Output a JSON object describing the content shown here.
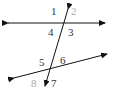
{
  "diagram": {
    "colors": {
      "line": "#111111",
      "label_dark": "#333333",
      "label_light": "#aaaaaa"
    },
    "labels": [
      {
        "text": "1",
        "x": 51,
        "y": 6,
        "color": "#333333"
      },
      {
        "text": "2",
        "x": 71,
        "y": 6,
        "color": "#aaaaaa"
      },
      {
        "text": "4",
        "x": 48,
        "y": 27,
        "color": "#333333"
      },
      {
        "text": "3",
        "x": 68,
        "y": 27,
        "color": "#333333"
      },
      {
        "text": "5",
        "x": 39,
        "y": 57,
        "color": "#333333"
      },
      {
        "text": "6",
        "x": 60,
        "y": 55,
        "color": "#333333"
      },
      {
        "text": "8",
        "x": 31,
        "y": 78,
        "color": "#aaaaaa"
      },
      {
        "text": "7",
        "x": 51,
        "y": 78,
        "color": "#333333"
      }
    ]
  }
}
